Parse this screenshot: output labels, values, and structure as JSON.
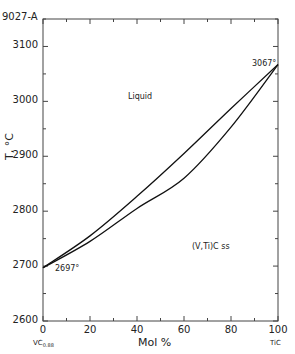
{
  "figure": {
    "id_label": "9027-A",
    "left_end_label": "VC",
    "left_end_subscript": "0.88",
    "right_end_label": "TiC"
  },
  "chart_data": {
    "type": "line",
    "title": "",
    "xlabel": "Mol %",
    "ylabel": "T, °C",
    "xlim": [
      0,
      100
    ],
    "ylim": [
      2600,
      3150
    ],
    "x_ticks": [
      0,
      20,
      40,
      60,
      80,
      100
    ],
    "y_ticks": [
      2600,
      2700,
      2800,
      2900,
      3000,
      3100
    ],
    "grid": false,
    "legend": null,
    "series": [
      {
        "name": "Liquidus",
        "x": [
          0,
          20,
          40,
          60,
          80,
          100
        ],
        "y": [
          2697,
          2755,
          2827,
          2905,
          2987,
          3067
        ]
      },
      {
        "name": "Solidus",
        "x": [
          0,
          20,
          40,
          60,
          80,
          100
        ],
        "y": [
          2697,
          2745,
          2805,
          2860,
          2953,
          3067
        ]
      }
    ],
    "annotations": [
      {
        "text": "Liquid",
        "x": 38,
        "y": 2980
      },
      {
        "text": "(V,Ti)C ss",
        "x": 72,
        "y": 2715
      },
      {
        "text": "3067°",
        "x": 95,
        "y": 3067
      },
      {
        "text": "2697°",
        "x": 7,
        "y": 2680
      }
    ]
  }
}
